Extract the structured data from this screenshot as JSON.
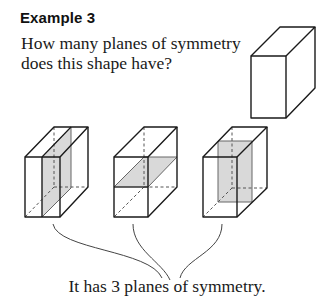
{
  "example": {
    "heading": "Example 3",
    "question": "How many planes of symmetry does this shape have?",
    "answer": "It has 3 planes of symmetry."
  },
  "figure": {
    "main_shape": "cuboid",
    "planes": [
      {
        "label": "vertical plane parallel to side faces",
        "orientation": "vertical-side"
      },
      {
        "label": "horizontal plane",
        "orientation": "horizontal"
      },
      {
        "label": "vertical plane parallel to front face",
        "orientation": "vertical-front"
      }
    ],
    "colors": {
      "line": "#1a1a1a",
      "shade": "#d9d9d9",
      "hidden_edge": "#555555"
    }
  }
}
